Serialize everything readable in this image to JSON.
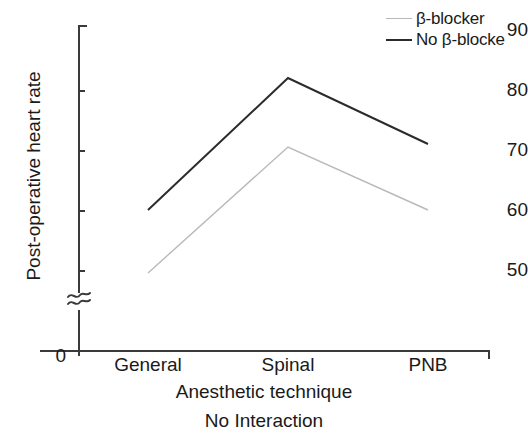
{
  "chart_data": {
    "type": "line",
    "title": "",
    "subtitle": "",
    "caption": "No Interaction",
    "xlabel": "Anesthetic technique",
    "ylabel": "Post-operative heart rate",
    "categories": [
      "General",
      "Spinal",
      "PNB"
    ],
    "series": [
      {
        "name": "β-blocker",
        "values": [
          49.5,
          70.5,
          60.0
        ],
        "color": "#b9b9b9",
        "width": 1.4
      },
      {
        "name": "No β-blocke",
        "values": [
          60.0,
          82.0,
          71.0
        ],
        "color": "#2b2b2b",
        "width": 2.0
      }
    ],
    "yticks": [
      50,
      60,
      70,
      80,
      90
    ],
    "ytick_labels": [
      "50",
      "60",
      "70",
      "80",
      "90"
    ],
    "ylim": [
      50,
      90
    ],
    "y_origin_label": "0",
    "y_axis_break": true,
    "y_axis_break_glyph": "≈",
    "grid": false,
    "legend_position": "top-right"
  },
  "legend": {
    "entries": [
      {
        "label": "β-blocker",
        "swatch": "legend-line-light"
      },
      {
        "label": "No β-blocke",
        "swatch": "legend-line-dark"
      }
    ]
  },
  "axes": {
    "y_title": "Post-operative heart rate",
    "x_title": "Anesthetic technique",
    "zero": "0",
    "break_symbol": "≈",
    "y_labels": {
      "t90": "90",
      "t80": "80",
      "t70": "70",
      "t60": "60",
      "t50": "50"
    },
    "x_labels": {
      "c0": "General",
      "c1": "Spinal",
      "c2": "PNB"
    }
  },
  "figure": {
    "caption": "No Interaction"
  }
}
